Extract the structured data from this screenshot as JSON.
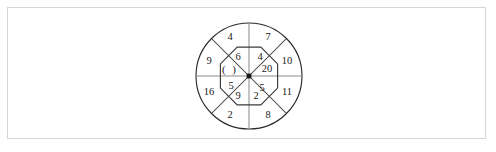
{
  "page": {
    "background_color": "#ffffff",
    "frame_color": "#d5d5d5"
  },
  "figure": {
    "name": "circle-octagon-number-puzzle",
    "center": {
      "x": 249,
      "y": 76
    },
    "outer_radius": 53,
    "inner_octagon_radius": 31,
    "stroke_color": "#2b2b2b",
    "text_color": "#1a1a1a",
    "blank_marker": "(   )",
    "outer_ring": [
      {
        "position": "top-left",
        "label": "4",
        "x": 230,
        "y": 38
      },
      {
        "position": "top-right",
        "label": "7",
        "x": 268,
        "y": 38
      },
      {
        "position": "right-upper",
        "label": "10",
        "x": 287,
        "y": 62
      },
      {
        "position": "right-lower",
        "label": "11",
        "x": 287,
        "y": 93
      },
      {
        "position": "bottom-right",
        "label": "8",
        "x": 268,
        "y": 116
      },
      {
        "position": "bottom-left",
        "label": "2",
        "x": 230,
        "y": 116
      },
      {
        "position": "left-lower",
        "label": "16",
        "x": 209,
        "y": 93
      },
      {
        "position": "left-upper",
        "label": "9",
        "x": 209,
        "y": 62
      }
    ],
    "inner_octagon": [
      {
        "position": "top-left",
        "label": "6",
        "x": 238,
        "y": 58,
        "is_blank": false
      },
      {
        "position": "top-right",
        "label": "4",
        "x": 260,
        "y": 58,
        "is_blank": false
      },
      {
        "position": "right",
        "label": "20",
        "x": 267,
        "y": 70,
        "is_blank": false
      },
      {
        "position": "right-lower",
        "label": "5",
        "x": 262,
        "y": 89,
        "is_blank": false
      },
      {
        "position": "bottom-right",
        "label": "2",
        "x": 256,
        "y": 97,
        "is_blank": false
      },
      {
        "position": "bottom-left",
        "label": "9",
        "x": 238,
        "y": 97,
        "is_blank": false
      },
      {
        "position": "left-lower",
        "label": "5",
        "x": 231,
        "y": 87,
        "is_blank": false
      },
      {
        "position": "left",
        "label": "(   )",
        "x": 230,
        "y": 70,
        "is_blank": true
      }
    ]
  }
}
